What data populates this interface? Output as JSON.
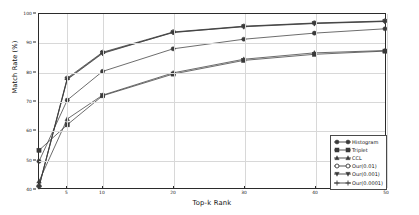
{
  "chart_data": {
    "type": "line",
    "title": "",
    "xlabel": "Top-k Rank",
    "ylabel": "Match Rate (%)",
    "x": [
      1,
      5,
      10,
      20,
      30,
      40,
      50
    ],
    "xticks": [
      5,
      10,
      20,
      30,
      40,
      50
    ],
    "yticks": [
      40,
      50,
      60,
      70,
      80,
      90,
      100
    ],
    "xlim": [
      1,
      50
    ],
    "ylim": [
      40,
      100
    ],
    "grid": true,
    "legend_position": "lower right",
    "series": [
      {
        "name": "Histogram",
        "marker": "circle-filled",
        "color": "#3a3a3a",
        "values": [
          49.2,
          70.3,
          80.2,
          88.0,
          91.3,
          93.4,
          94.9
        ]
      },
      {
        "name": "Triplet",
        "marker": "square-filled",
        "color": "#3a3a3a",
        "values": [
          53.0,
          61.8,
          71.8,
          79.3,
          84.0,
          86.1,
          87.2
        ]
      },
      {
        "name": "CCL",
        "marker": "triangle-up",
        "color": "#3a3a3a",
        "values": [
          42.3,
          63.8,
          72.0,
          79.7,
          84.4,
          86.6,
          87.4
        ]
      },
      {
        "name": "Our(0.01)",
        "marker": "circle-open",
        "color": "#3a3a3a",
        "values": [
          40.6,
          77.9,
          86.8,
          93.8,
          95.8,
          96.9,
          97.6
        ]
      },
      {
        "name": "Our(0.001)",
        "marker": "triangle-down",
        "color": "#3a3a3a",
        "values": [
          40.4,
          77.6,
          86.6,
          93.6,
          95.7,
          96.8,
          97.5
        ]
      },
      {
        "name": "Our(0.0001)",
        "marker": "plus",
        "color": "#3a3a3a",
        "values": [
          40.5,
          77.4,
          86.4,
          93.7,
          95.6,
          96.7,
          97.4
        ]
      }
    ]
  },
  "legend": {
    "items": [
      {
        "label": "Histogram"
      },
      {
        "label": "Triplet"
      },
      {
        "label": "CCL"
      },
      {
        "label": "Our(0.01)"
      },
      {
        "label": "Our(0.001)"
      },
      {
        "label": "Our(0.0001)"
      }
    ]
  },
  "axes": {
    "y_title": "Match Rate (%)",
    "x_title": "Top-k Rank",
    "y_tick_labels": [
      "100",
      "90",
      "80",
      "70",
      "60",
      "50",
      "40"
    ],
    "x_tick_labels": [
      "5",
      "10",
      "20",
      "30",
      "40",
      "50"
    ]
  }
}
